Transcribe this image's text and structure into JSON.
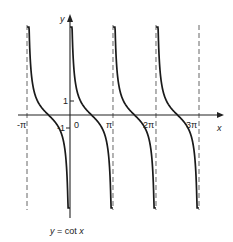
{
  "chart_data": {
    "type": "line",
    "title": "y = cot x",
    "xlabel": "x",
    "ylabel": "y",
    "function": "cot",
    "x_tick_labels": [
      "-π",
      "0",
      "π",
      "2π",
      "3π"
    ],
    "x_tick_values": [
      -3.14159,
      0,
      3.14159,
      6.28318,
      9.42478
    ],
    "y_tick_labels": [
      "1",
      "-1"
    ],
    "y_tick_values": [
      1,
      -1
    ],
    "asymptotes_x": [
      -3.14159,
      0,
      3.14159,
      6.28318,
      9.42478
    ],
    "branches": [
      {
        "from": -3.14159,
        "to": 0
      },
      {
        "from": 0,
        "to": 3.14159
      },
      {
        "from": 3.14159,
        "to": 6.28318
      },
      {
        "from": 6.28318,
        "to": 9.42478
      }
    ],
    "zeros_x": [
      -1.5708,
      1.5708,
      4.7124,
      7.854
    ],
    "ylim": [
      -7,
      6.5
    ],
    "xlim": [
      -4,
      12
    ],
    "grid": false,
    "legend": "none",
    "line_color": "#1a1a1a",
    "asymptote_style": "dashed"
  },
  "labels": {
    "y_axis": "y",
    "x_axis": "x",
    "origin": "0",
    "one": "1",
    "minus_one": "-1",
    "neg_pi": "-π",
    "pi": "π",
    "two_pi": "2π",
    "three_pi": "3π",
    "caption_prefix": "y",
    "caption_eq": " = cot ",
    "caption_var": "x"
  }
}
